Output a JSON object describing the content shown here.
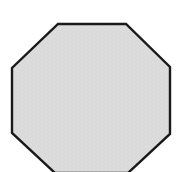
{
  "image": {
    "kind": "geometric-shape-figure",
    "width": 178,
    "height": 172,
    "background_color": "#ffffff",
    "alt_text": "Light gray octagon with a thick black outline on a white background, cropped slightly at the bottom"
  },
  "shape": {
    "name": "octagon",
    "sides": 8,
    "label": "Octagon",
    "fill_color": "#dcdcdc",
    "stroke_color": "#1a1a1a",
    "stroke_width": 2.4,
    "texture": "fine-dither-grain",
    "cropped_edge": "bottom",
    "points": "58,24 126,24 170,67 170,134 128,173 55,173 12,133 12,68",
    "vertices": [
      {
        "id": "top-left",
        "x": 58,
        "y": 24
      },
      {
        "id": "top-right",
        "x": 126,
        "y": 24
      },
      {
        "id": "right-upper",
        "x": 170,
        "y": 67
      },
      {
        "id": "right-lower",
        "x": 170,
        "y": 134
      },
      {
        "id": "bottom-right",
        "x": 128,
        "y": 173
      },
      {
        "id": "bottom-left",
        "x": 55,
        "y": 173
      },
      {
        "id": "left-lower",
        "x": 12,
        "y": 133
      },
      {
        "id": "left-upper",
        "x": 12,
        "y": 68
      }
    ]
  }
}
